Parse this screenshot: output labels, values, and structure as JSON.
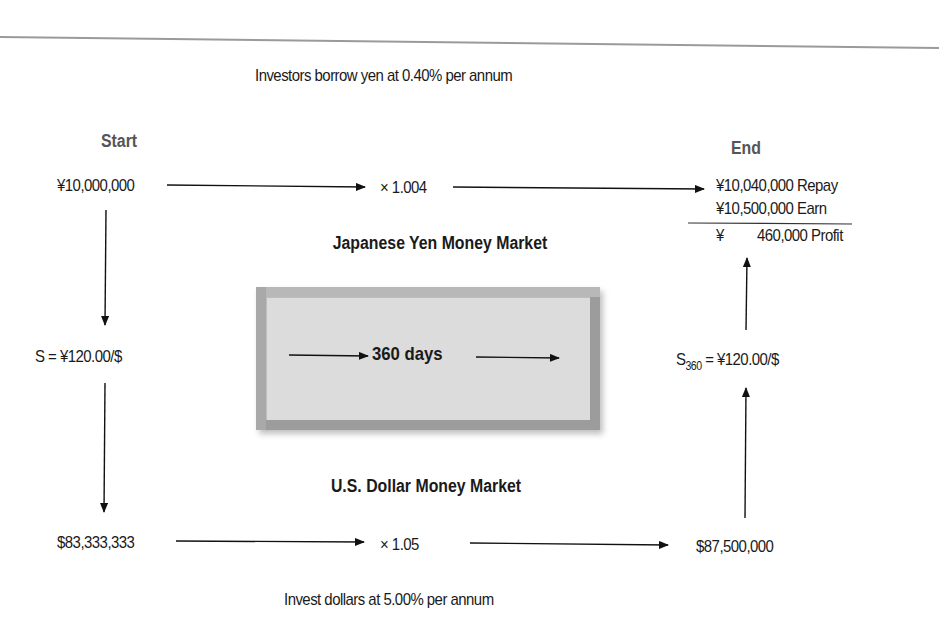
{
  "diagram": {
    "top_note": "Investors borrow yen at 0.40% per annum",
    "bottom_note": "Invest dollars at 5.00% per annum",
    "start": {
      "label": "Start",
      "yen_amount": "¥10,000,000",
      "spot_rate": "S = ¥120.00/$",
      "dollar_amount": "$83,333,333"
    },
    "yen_market": {
      "label": "Japanese Yen Money Market",
      "multiplier": "× 1.004"
    },
    "dollar_market": {
      "label": "U.S. Dollar Money Market",
      "multiplier": "× 1.05"
    },
    "period_box": {
      "label": "360 days"
    },
    "end": {
      "label": "End",
      "repay": "¥10,040,000 Repay",
      "earn": "¥10,500,000 Earn",
      "profit_currency": "¥",
      "profit": "460,000 Profit",
      "future_rate_symbol": "S",
      "future_rate_subscript": "360",
      "future_rate_value": " = ¥120.00/$",
      "dollar_amount": "$87,500,000"
    },
    "colors": {
      "text": "#1a1a1a",
      "heading_gray": "#555555",
      "rule": "#9a9a9a",
      "box_frame": "#9c9c9c",
      "box_fill": "#dcdcdc"
    }
  }
}
